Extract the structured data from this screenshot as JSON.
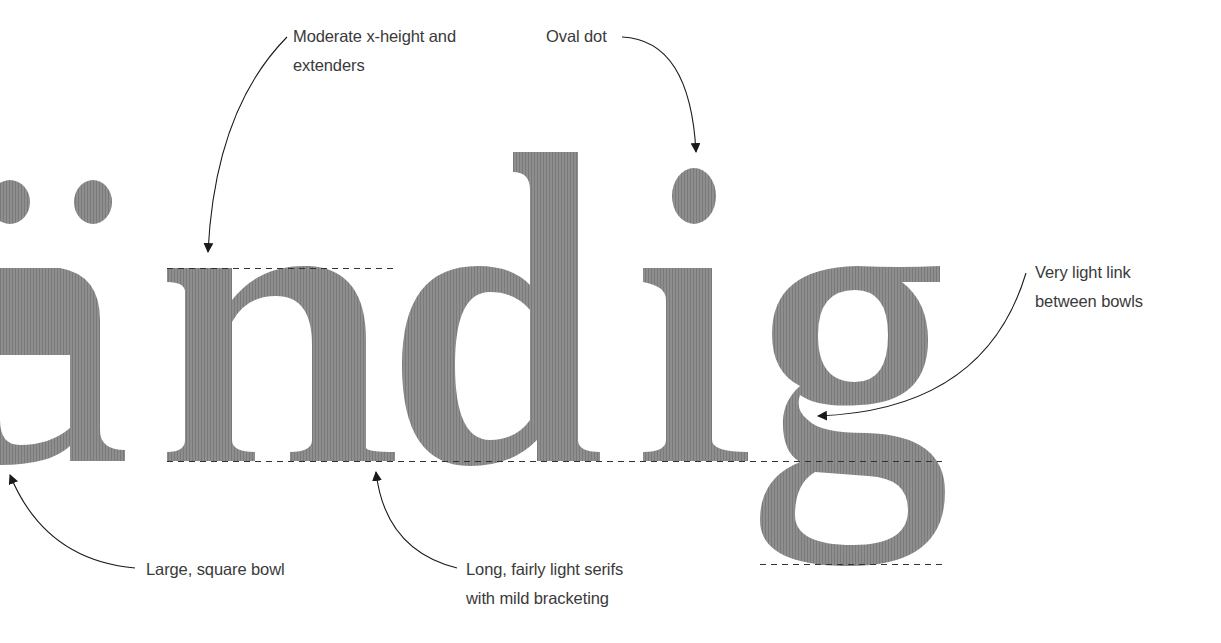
{
  "specimen": {
    "word": "ändig",
    "glyph_color": "#8c8c8c",
    "guide_color": "#333333",
    "arrow_color": "#1a1a1a"
  },
  "annotations": [
    {
      "id": "x-height",
      "lines": [
        "Moderate x-height and",
        "extenders"
      ]
    },
    {
      "id": "oval-dot",
      "lines": [
        "Oval dot"
      ]
    },
    {
      "id": "link",
      "lines": [
        "Very light link",
        "between bowls"
      ]
    },
    {
      "id": "bowl",
      "lines": [
        "Large, square bowl"
      ]
    },
    {
      "id": "serifs",
      "lines": [
        "Long, fairly light serifs",
        "with mild bracketing"
      ]
    }
  ],
  "guides": {
    "x_height_y": 268,
    "baseline_y": 461,
    "descender_y": 564
  }
}
